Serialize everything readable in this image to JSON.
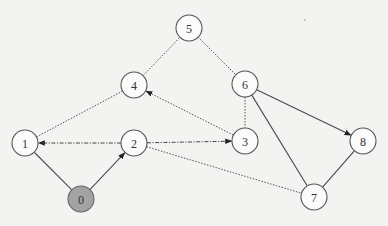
{
  "diagram": {
    "type": "graph",
    "colors": {
      "background": "#f3f3f1",
      "node_fill": "#fbfbfa",
      "start_node_fill": "#a3a3a3",
      "stroke": "#555555"
    },
    "nodes": [
      {
        "id": "0",
        "label": "0",
        "x": 81,
        "y": 199,
        "highlighted": true
      },
      {
        "id": "1",
        "label": "1",
        "x": 25,
        "y": 143,
        "highlighted": false
      },
      {
        "id": "2",
        "label": "2",
        "x": 134,
        "y": 143,
        "highlighted": false
      },
      {
        "id": "3",
        "label": "3",
        "x": 245,
        "y": 141,
        "highlighted": false
      },
      {
        "id": "4",
        "label": "4",
        "x": 134,
        "y": 85,
        "highlighted": false
      },
      {
        "id": "5",
        "label": "5",
        "x": 189,
        "y": 28,
        "highlighted": false
      },
      {
        "id": "6",
        "label": "6",
        "x": 245,
        "y": 84,
        "highlighted": false
      },
      {
        "id": "7",
        "label": "7",
        "x": 314,
        "y": 197,
        "highlighted": false
      },
      {
        "id": "8",
        "label": "8",
        "x": 363,
        "y": 141,
        "highlighted": false
      }
    ],
    "edges": [
      {
        "from": "0",
        "to": "1",
        "style": "solid",
        "directed": false
      },
      {
        "from": "0",
        "to": "2",
        "style": "solid",
        "directed": true
      },
      {
        "from": "2",
        "to": "1",
        "style": "dashdot",
        "directed": true
      },
      {
        "from": "2",
        "to": "3",
        "style": "dashdot",
        "directed": true
      },
      {
        "from": "2",
        "to": "7",
        "style": "dotted",
        "directed": false
      },
      {
        "from": "1",
        "to": "4",
        "style": "dotted",
        "directed": false
      },
      {
        "from": "3",
        "to": "4",
        "style": "dotted",
        "directed": true
      },
      {
        "from": "4",
        "to": "5",
        "style": "dotted",
        "directed": false
      },
      {
        "from": "5",
        "to": "6",
        "style": "dotted",
        "directed": false
      },
      {
        "from": "6",
        "to": "3",
        "style": "dotted",
        "directed": false
      },
      {
        "from": "6",
        "to": "8",
        "style": "solid",
        "directed": true
      },
      {
        "from": "6",
        "to": "7",
        "style": "solid",
        "directed": false
      },
      {
        "from": "7",
        "to": "8",
        "style": "solid",
        "directed": false
      }
    ]
  }
}
